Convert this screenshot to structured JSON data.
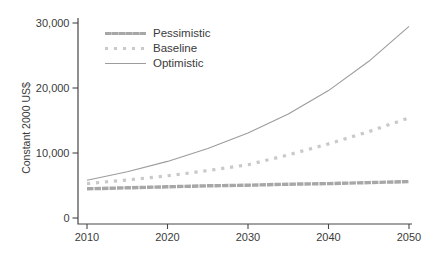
{
  "figure": {
    "background": "#ffffff",
    "axis_color": "#474747",
    "text_color": "#3b3b3b"
  },
  "chart_data": {
    "type": "line",
    "title": "",
    "xlabel": "",
    "ylabel": "Constant 2000 US$",
    "xlim": [
      2010,
      2050
    ],
    "ylim": [
      0,
      30000
    ],
    "grid": false,
    "legend_position": "top-left-inside",
    "x": [
      2010,
      2015,
      2020,
      2025,
      2030,
      2035,
      2040,
      2045,
      2050
    ],
    "xticks": [
      2010,
      2020,
      2030,
      2040,
      2050
    ],
    "yticks": [
      0,
      10000,
      20000,
      30000
    ],
    "ytick_labels": [
      "0",
      "10,000",
      "20,000",
      "30,000"
    ],
    "series": [
      {
        "name": "Pessimistic",
        "style": "thick",
        "color": "#a7a7a7",
        "values": [
          4500,
          4650,
          4800,
          4950,
          5050,
          5200,
          5300,
          5450,
          5600
        ]
      },
      {
        "name": "Baseline",
        "style": "dotted",
        "color": "#c9c9c9",
        "values": [
          5300,
          5850,
          6500,
          7300,
          8200,
          9700,
          11400,
          13300,
          15400
        ]
      },
      {
        "name": "Optimistic",
        "style": "thin",
        "color": "#9c9c9c",
        "values": [
          5800,
          7100,
          8700,
          10700,
          13100,
          16000,
          19600,
          24100,
          29500
        ]
      }
    ]
  }
}
